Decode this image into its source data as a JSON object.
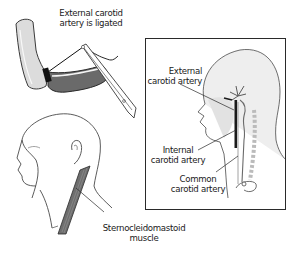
{
  "figure": {
    "panels": [
      {
        "id": "ligation",
        "caption_lines": [
          "External carotid",
          "artery is ligated"
        ]
      },
      {
        "id": "head-inset",
        "labels": [
          {
            "lines": [
              "External",
              "carotid artery"
            ]
          },
          {
            "lines": [
              "Internal",
              "carotid artery"
            ]
          },
          {
            "lines": [
              "Common",
              "carotid artery"
            ]
          }
        ]
      },
      {
        "id": "neck-muscle",
        "caption_lines": [
          "Sternocleidomastoid",
          "muscle"
        ]
      }
    ],
    "colors": {
      "outline": "#3a3a3a",
      "skin_fill": "#ececec",
      "artery_dark": "#555555",
      "artery_light": "#9a9a9a",
      "muscle": "#6e6e6e",
      "box_border": "#2a2a2a"
    }
  }
}
